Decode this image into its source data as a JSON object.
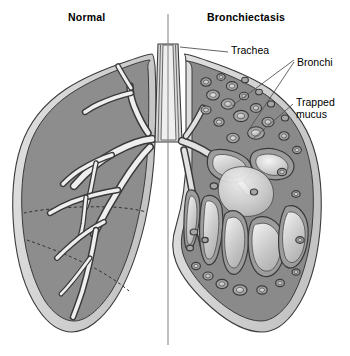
{
  "figure": {
    "type": "medical-illustration",
    "titles": {
      "left": "Normal",
      "right": "Bronchiectasis"
    },
    "labels": [
      {
        "id": "trachea",
        "text": "Trachea"
      },
      {
        "id": "bronchi",
        "text": "Bronchi"
      },
      {
        "id": "mucus",
        "text": "Trapped\nmucus",
        "line1": "Trapped",
        "line2": "mucus"
      }
    ],
    "colors": {
      "background": "#ffffff",
      "lung_parenchyma": "#8d8d8d",
      "lung_parenchyma_dark": "#7e7e7e",
      "pleura": "#d2d2d2",
      "airway_lumen": "#f2f2f2",
      "airway_wall": "#4a4a4a",
      "mucus_fill": "#c9c9c9",
      "mucus_highlight": "#ececec",
      "outline": "#3a3a3a",
      "leader_line": "#555555",
      "divider": "#8a8a8a",
      "text": "#000000"
    }
  }
}
